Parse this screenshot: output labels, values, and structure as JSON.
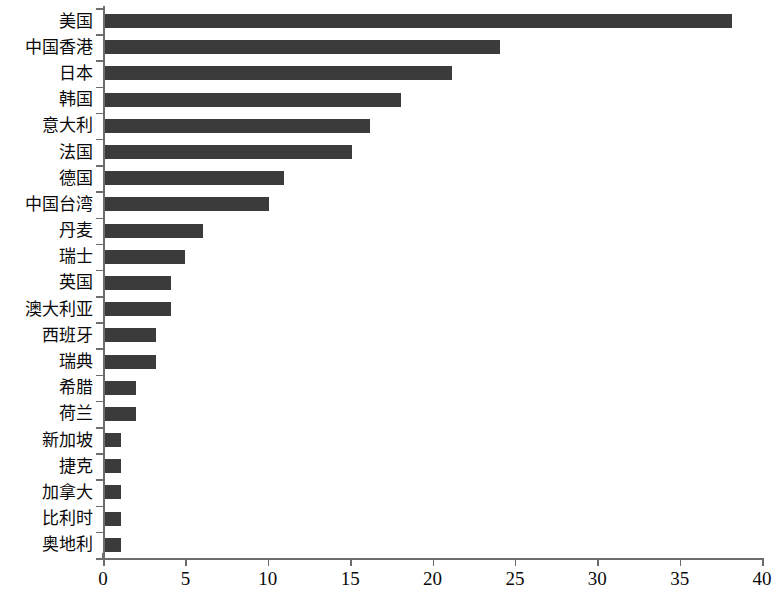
{
  "chart_data": {
    "type": "bar",
    "orientation": "horizontal",
    "title": "",
    "subtitle": "",
    "xlabel": "",
    "ylabel": "",
    "xlim": [
      0,
      40
    ],
    "xticks": [
      0,
      5,
      10,
      15,
      20,
      25,
      30,
      35,
      40
    ],
    "grid": false,
    "legend": null,
    "bar_color": "#3b3b3b",
    "axis_color": "#6d6d6d",
    "categories": [
      "美国",
      "中国香港",
      "日本",
      "韩国",
      "意大利",
      "法国",
      "德国",
      "中国台湾",
      "丹麦",
      "瑞士",
      "英国",
      "澳大利亚",
      "西班牙",
      "瑞典",
      "希腊",
      "荷兰",
      "新加坡",
      "捷克",
      "加拿大",
      "比利时",
      "奥地利"
    ],
    "values": [
      38.2,
      24.1,
      21.2,
      18.1,
      16.2,
      15.1,
      11.0,
      10.1,
      6.1,
      5.0,
      4.1,
      4.1,
      3.2,
      3.2,
      2.0,
      2.0,
      1.1,
      1.1,
      1.1,
      1.1,
      1.1
    ]
  }
}
